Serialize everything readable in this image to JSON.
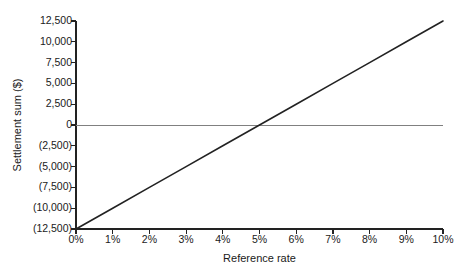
{
  "chart_data": {
    "type": "line",
    "title": "",
    "xlabel": "Reference rate",
    "ylabel": "Settlement sum ($)",
    "xlim": [
      0,
      10
    ],
    "ylim": [
      -12500,
      12500
    ],
    "grid": false,
    "legend": "none",
    "x_tick_labels": [
      "0%",
      "1%",
      "2%",
      "3%",
      "4%",
      "5%",
      "6%",
      "7%",
      "8%",
      "9%",
      "10%"
    ],
    "x_tick_values": [
      0,
      1,
      2,
      3,
      4,
      5,
      6,
      7,
      8,
      9,
      10
    ],
    "y_tick_labels": [
      "12,500",
      "10,000",
      "7,500",
      "5,000",
      "2,500",
      "0",
      "(2,500)",
      "(5,000)",
      "(7,500)",
      "(10,000)",
      "(12,500)"
    ],
    "y_tick_values": [
      12500,
      10000,
      7500,
      5000,
      2500,
      0,
      -2500,
      -5000,
      -7500,
      -10000,
      -12500
    ],
    "series": [
      {
        "name": "Settlement sum",
        "color": "#222222",
        "x": [
          0,
          1,
          2,
          3,
          4,
          5,
          6,
          7,
          8,
          9,
          10
        ],
        "values": [
          -12500,
          -10000,
          -7500,
          -5000,
          -2500,
          0,
          2500,
          5000,
          7500,
          10000,
          12500
        ]
      }
    ],
    "reference_line": {
      "name": "zero-line",
      "y": 0,
      "color": "#808080"
    },
    "annotations": {
      "break_even_rate": "5%"
    }
  },
  "colors": {
    "axis": "#222222",
    "data_line": "#222222",
    "zero_line": "#808080",
    "background": "#ffffff",
    "text": "#1a1a1a"
  }
}
